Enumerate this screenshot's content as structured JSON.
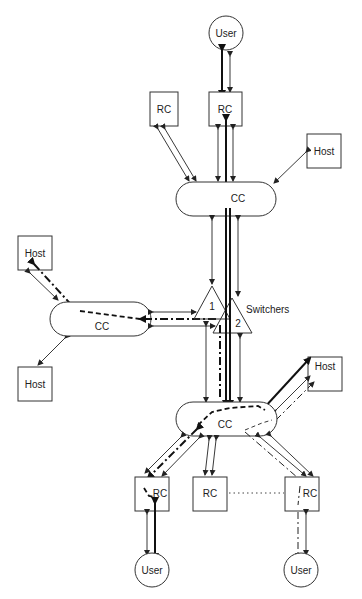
{
  "diagram": {
    "nodes": {
      "user_top": {
        "label": "User",
        "type": "circle"
      },
      "rc_top_left": {
        "label": "RC",
        "type": "box"
      },
      "rc_top_center": {
        "label": "RC",
        "type": "box"
      },
      "host_top_right": {
        "label": "Host",
        "type": "box"
      },
      "cc_top": {
        "label": "CC",
        "type": "pill"
      },
      "host_left_top": {
        "label": "Host",
        "type": "box"
      },
      "host_left_bottom": {
        "label": "Host",
        "type": "box"
      },
      "cc_left": {
        "label": "CC",
        "type": "pill"
      },
      "switcher_1": {
        "label": "1",
        "type": "triangle"
      },
      "switcher_2": {
        "label": "2",
        "type": "triangle"
      },
      "switchers_label": {
        "label": "Switchers"
      },
      "host_bottom_right": {
        "label": "Host",
        "type": "box"
      },
      "cc_bottom": {
        "label": "CC",
        "type": "pill"
      },
      "rc_bottom_left": {
        "label": "RC",
        "type": "box"
      },
      "rc_bottom_center": {
        "label": "RC",
        "type": "box"
      },
      "rc_bottom_right": {
        "label": "RC",
        "type": "box"
      },
      "user_bottom_left": {
        "label": "User",
        "type": "circle"
      },
      "user_bottom_right": {
        "label": "User",
        "type": "circle"
      }
    },
    "line_styles": {
      "thin": "bidirectional link",
      "thick": "active connection path",
      "dash_dot": "routed path",
      "dotted": "RC chain"
    }
  }
}
